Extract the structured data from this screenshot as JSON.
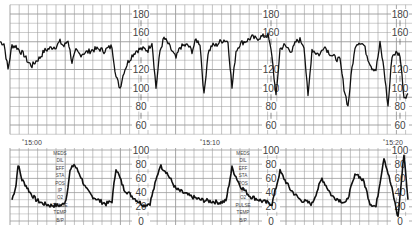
{
  "chart_data": [
    {
      "type": "line",
      "title": "Fetal Heart Rate",
      "ylabel": "bpm",
      "ylim": [
        50,
        190
      ],
      "yticks": [
        180,
        160,
        140,
        120,
        100,
        80,
        60
      ],
      "ytick_labels": [
        "180",
        "160",
        "120",
        "100",
        "80",
        "60"
      ],
      "grid": true,
      "series": [
        {
          "name": "FHR",
          "x": [
            0,
            4,
            8,
            12,
            16,
            20,
            24,
            28,
            32,
            36,
            40,
            44,
            48,
            52,
            56,
            60,
            64,
            68,
            72,
            76,
            80,
            84,
            88,
            92,
            96,
            100,
            104,
            108,
            112,
            116,
            120,
            124,
            128,
            132,
            136,
            140,
            144,
            148,
            152,
            156,
            160,
            164,
            168,
            172,
            176,
            180,
            184,
            188,
            192,
            196,
            200,
            204,
            208,
            212,
            216,
            220,
            224,
            228,
            232,
            236,
            240,
            244,
            248,
            252,
            256,
            260,
            264,
            268,
            272,
            276,
            280,
            284,
            288,
            292,
            296,
            300,
            304,
            308,
            312,
            316,
            320,
            324,
            328,
            332,
            336,
            340,
            344,
            348,
            352,
            356,
            360,
            364,
            368,
            372,
            376,
            380,
            384,
            388,
            392,
            396,
            400,
            404,
            408
          ],
          "values": [
            150,
            148,
            120,
            146,
            145,
            140,
            136,
            128,
            124,
            129,
            133,
            140,
            142,
            144,
            145,
            150,
            145,
            152,
            128,
            140,
            136,
            138,
            139,
            141,
            142,
            142,
            140,
            143,
            145,
            112,
            100,
            118,
            128,
            135,
            140,
            142,
            142,
            141,
            150,
            100,
            140,
            154,
            148,
            140,
            132,
            144,
            146,
            146,
            140,
            152,
            148,
            92,
            138,
            146,
            146,
            150,
            152,
            150,
            100,
            140,
            148,
            150,
            152,
            155,
            153,
            155,
            156,
            157,
            135,
            90,
            142,
            146,
            143,
            140,
            150,
            152,
            146,
            90,
            142,
            138,
            136,
            146,
            140,
            135,
            132,
            130,
            100,
            80,
            122,
            148,
            150,
            146,
            132,
            122,
            120,
            148,
            120,
            80,
            135,
            138,
            136,
            90,
            94
          ]
        }
      ]
    },
    {
      "type": "line",
      "title": "Uterine Activity",
      "ylabel": "mmHg",
      "ylim": [
        0,
        100
      ],
      "yticks": [
        100,
        80,
        60,
        40,
        20,
        0
      ],
      "ytick_labels": [
        "100",
        "80",
        "60",
        "40",
        "20",
        "0"
      ],
      "grid": true,
      "time_labels": [
        "15:00",
        "15:10",
        "15:20"
      ],
      "series": [
        {
          "name": "UA",
          "x": [
            12,
            16,
            18,
            22,
            26,
            30,
            36,
            42,
            50,
            56,
            62,
            66,
            70,
            74,
            80,
            86,
            92,
            100,
            106,
            112,
            116,
            124,
            132,
            138,
            144,
            150,
            160,
            166,
            176,
            190,
            200,
            210,
            220,
            226,
            232,
            240,
            250,
            262,
            272,
            280,
            290,
            300,
            312,
            322,
            332,
            346,
            356,
            364,
            370,
            376,
            384,
            392,
            398,
            404,
            408
          ],
          "values": [
            30,
            50,
            80,
            58,
            50,
            40,
            30,
            25,
            22,
            22,
            22,
            30,
            70,
            80,
            65,
            45,
            35,
            28,
            24,
            28,
            75,
            45,
            35,
            28,
            22,
            25,
            78,
            70,
            45,
            35,
            30,
            28,
            26,
            28,
            75,
            50,
            35,
            28,
            24,
            70,
            45,
            30,
            24,
            60,
            35,
            25,
            68,
            55,
            25,
            20,
            90,
            45,
            5,
            95,
            30
          ]
        }
      ]
    }
  ],
  "annotation_labels": [
    "MEDS",
    "DIL",
    "EFF",
    "STA",
    "POS",
    "IP",
    "O2",
    "PULSE",
    "TEMP",
    "B/P"
  ],
  "annotation_columns": 2,
  "colors": {
    "trace": "#111111",
    "grid": "#9a9a9a",
    "label": "#444444",
    "background": "#ffffff"
  }
}
